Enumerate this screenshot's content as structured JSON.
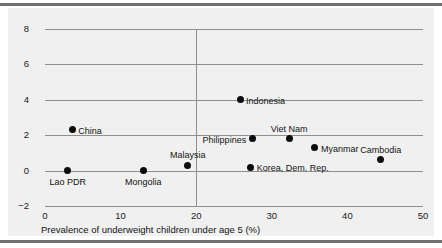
{
  "chart_data": {
    "type": "scatter",
    "title": "",
    "xlabel": "Prevalence of underweight children under age 5 (%)",
    "ylabel": "",
    "xlim": [
      0,
      50
    ],
    "ylim": [
      -2,
      8
    ],
    "xticks": [
      "0",
      "10",
      "20",
      "30",
      "40",
      "50"
    ],
    "yticks": [
      "8",
      "6",
      "4",
      "2",
      "0",
      "-2"
    ],
    "grid": "horizontal gridlines at every y tick; single vertical reference line at x = 20",
    "legend": "none",
    "points": [
      {
        "label": "Lao PDR",
        "x": 3.0,
        "y": 0.0,
        "label_pos": "below"
      },
      {
        "label": "China",
        "x": 3.6,
        "y": 2.3,
        "label_pos": "right"
      },
      {
        "label": "Mongolia",
        "x": 13.0,
        "y": 0.0,
        "label_pos": "below"
      },
      {
        "label": "Malaysia",
        "x": 18.9,
        "y": 0.3,
        "label_pos": "above"
      },
      {
        "label": "Indonesia",
        "x": 25.8,
        "y": 4.0,
        "label_pos": "right"
      },
      {
        "label": "Korea, Dem. Rep.",
        "x": 27.2,
        "y": 0.2,
        "label_pos": "right"
      },
      {
        "label": "Philippines",
        "x": 27.4,
        "y": 1.8,
        "label_pos": "left"
      },
      {
        "label": "Viet Nam",
        "x": 32.3,
        "y": 1.8,
        "label_pos": "above"
      },
      {
        "label": "Myanmar",
        "x": 35.7,
        "y": 1.3,
        "label_pos": "right"
      },
      {
        "label": "Cambodia",
        "x": 44.4,
        "y": 0.6,
        "label_pos": "above"
      }
    ],
    "reference_line_x": 20,
    "colors": {
      "panel_background": "#f0f0f0",
      "point": "#0d0d0d",
      "gridline": "#8d8f91",
      "rule": "#6f7173",
      "text": "#141414"
    }
  }
}
